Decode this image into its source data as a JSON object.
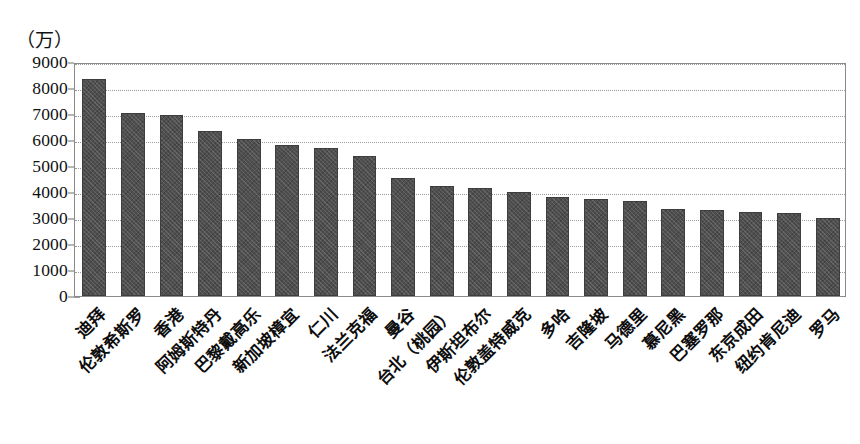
{
  "chart_data": {
    "type": "bar",
    "title": "",
    "subtitle": "",
    "unit_label": "（万）",
    "xlabel": "",
    "ylabel": "",
    "ylim": [
      0,
      9000
    ],
    "ytick_step": 1000,
    "grid": true,
    "legend": null,
    "orientation": "vertical",
    "bar_color": "#4f4f4f",
    "categories": [
      "迪拜",
      "伦敦希斯罗",
      "香港",
      "阿姆斯特丹",
      "巴黎戴高乐",
      "新加坡樟宜",
      "仁川",
      "法兰克福",
      "曼谷",
      "台北（桃园）",
      "伊斯坦布尔",
      "伦敦盖特威克",
      "多哈",
      "吉隆坡",
      "马德里",
      "慕尼黑",
      "巴塞罗那",
      "东京成田",
      "纽约肯尼迪",
      "罗马"
    ],
    "values": [
      8350,
      7050,
      6950,
      6350,
      6050,
      5800,
      5700,
      5400,
      4550,
      4250,
      4150,
      4000,
      3800,
      3750,
      3650,
      3350,
      3300,
      3250,
      3200,
      3000
    ],
    "ytick_labels": [
      "9000",
      "8000",
      "7000",
      "6000",
      "5000",
      "4000",
      "3000",
      "2000",
      "1000",
      "0"
    ],
    "ytick_values": [
      9000,
      8000,
      7000,
      6000,
      5000,
      4000,
      3000,
      2000,
      1000,
      0
    ]
  },
  "caption": ""
}
